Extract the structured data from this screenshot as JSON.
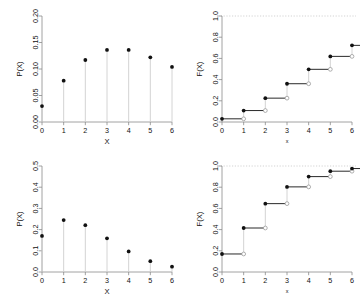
{
  "figure": {
    "layout": "2x2 panel grid",
    "background": "#ffffff",
    "point_color": "#111111",
    "stem_color": "#cfcfcf",
    "axis_color": "#8a8a8a",
    "refline_color": "#c8c8c8"
  },
  "chart_data": [
    {
      "id": "pmf-top-left",
      "type": "scatter",
      "variant": "stem-pmf",
      "title": "",
      "xlabel": "X",
      "ylabel": "P(X)",
      "x": [
        0,
        1,
        2,
        3,
        4,
        5,
        6
      ],
      "values": [
        0.03,
        0.078,
        0.117,
        0.136,
        0.136,
        0.122,
        0.104
      ],
      "xlim": [
        0,
        6
      ],
      "ylim": [
        0.0,
        0.2
      ],
      "xticks": [
        "0",
        "1",
        "2",
        "3",
        "4",
        "5",
        "6"
      ],
      "yticks": [
        "0.00",
        "0.05",
        "0.10",
        "0.15",
        "0.20"
      ],
      "ytickvals": [
        0.0,
        0.05,
        0.1,
        0.15,
        0.2
      ],
      "grid": false,
      "legend": "none"
    },
    {
      "id": "cdf-top-right",
      "type": "line",
      "variant": "step-ecdf",
      "title": "",
      "xlabel": "x",
      "ylabel": "F(X)",
      "x": [
        0,
        1,
        2,
        3,
        4,
        5,
        6
      ],
      "values": [
        0.03,
        0.108,
        0.225,
        0.361,
        0.497,
        0.619,
        0.723
      ],
      "xlim": [
        0,
        6
      ],
      "ylim": [
        0.0,
        1.0
      ],
      "xticks": [
        "0",
        "1",
        "2",
        "3",
        "4",
        "5",
        "6"
      ],
      "yticks": [
        "0.0",
        "0.2",
        "0.4",
        "0.6",
        "0.8",
        "1.0"
      ],
      "ytickvals": [
        0.0,
        0.2,
        0.4,
        0.6,
        0.8,
        1.0
      ],
      "reference_line": 1.0,
      "closed_marker": "filled-circle",
      "open_marker": "open-circle",
      "grid": false,
      "legend": "none"
    },
    {
      "id": "pmf-bottom-left",
      "type": "scatter",
      "variant": "stem-pmf",
      "title": "",
      "xlabel": "X",
      "ylabel": "P(X)",
      "x": [
        0,
        1,
        2,
        3,
        4,
        5,
        6
      ],
      "values": [
        0.17,
        0.245,
        0.221,
        0.159,
        0.097,
        0.051,
        0.025
      ],
      "xlim": [
        0,
        6
      ],
      "ylim": [
        0.0,
        0.5
      ],
      "xticks": [
        "0",
        "1",
        "2",
        "3",
        "4",
        "5",
        "6"
      ],
      "yticks": [
        "0.0",
        "0.1",
        "0.2",
        "0.3",
        "0.4",
        "0.5"
      ],
      "ytickvals": [
        0.0,
        0.1,
        0.2,
        0.3,
        0.4,
        0.5
      ],
      "grid": false,
      "legend": "none"
    },
    {
      "id": "cdf-bottom-right",
      "type": "line",
      "variant": "step-ecdf",
      "title": "",
      "xlabel": "x",
      "ylabel": "F(X)",
      "x": [
        0,
        1,
        2,
        3,
        4,
        5,
        6
      ],
      "values": [
        0.17,
        0.415,
        0.645,
        0.803,
        0.9,
        0.951,
        0.976
      ],
      "xlim": [
        0,
        6
      ],
      "ylim": [
        0.0,
        1.0
      ],
      "xticks": [
        "0",
        "1",
        "2",
        "3",
        "4",
        "5",
        "6"
      ],
      "yticks": [
        "0.0",
        "0.2",
        "0.4",
        "0.6",
        "0.8",
        "1.0"
      ],
      "ytickvals": [
        0.0,
        0.2,
        0.4,
        0.6,
        0.8,
        1.0
      ],
      "reference_line": 1.0,
      "closed_marker": "filled-circle",
      "open_marker": "open-circle",
      "grid": false,
      "legend": "none"
    }
  ]
}
